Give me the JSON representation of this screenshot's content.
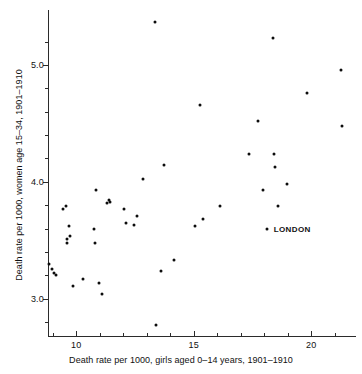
{
  "chart_data": {
    "type": "scatter",
    "title": "",
    "xlabel": "Death rate per 1000, girls aged  0–14 years, 1901–1910",
    "ylabel": "Death rate per 1000, women age 15–34, 1901–1910",
    "xlim": [
      8.8,
      21.9
    ],
    "ylim": [
      2.68,
      5.47
    ],
    "xticks": [
      10,
      15,
      20
    ],
    "xtick_labels": [
      "10",
      "15",
      "20"
    ],
    "xticks_minor": [
      9,
      11,
      12,
      13,
      14,
      16,
      17,
      18,
      19,
      21
    ],
    "yticks": [
      3.0,
      4.0,
      5.0
    ],
    "ytick_labels": [
      "3.0",
      "4.0",
      "5.0"
    ],
    "yticks_minor": [
      2.8,
      3.2,
      3.4,
      3.6,
      3.8,
      4.2,
      4.4,
      4.6,
      4.8,
      5.2
    ],
    "grid": false,
    "legend": false,
    "marker_color": "#0d0d0d",
    "axis_color": "#2b2b2b",
    "points": [
      {
        "x": 8.85,
        "y": 3.3
      },
      {
        "x": 8.95,
        "y": 3.25
      },
      {
        "x": 9.05,
        "y": 3.22
      },
      {
        "x": 9.15,
        "y": 3.2
      },
      {
        "x": 9.45,
        "y": 3.77
      },
      {
        "x": 9.55,
        "y": 3.79
      },
      {
        "x": 9.6,
        "y": 3.51
      },
      {
        "x": 9.62,
        "y": 3.48
      },
      {
        "x": 9.7,
        "y": 3.62
      },
      {
        "x": 9.75,
        "y": 3.54
      },
      {
        "x": 9.85,
        "y": 3.11
      },
      {
        "x": 10.3,
        "y": 3.17
      },
      {
        "x": 10.75,
        "y": 3.6
      },
      {
        "x": 10.8,
        "y": 3.48
      },
      {
        "x": 10.85,
        "y": 3.93
      },
      {
        "x": 10.95,
        "y": 3.13
      },
      {
        "x": 11.1,
        "y": 3.04
      },
      {
        "x": 11.3,
        "y": 3.82
      },
      {
        "x": 11.4,
        "y": 3.84
      },
      {
        "x": 11.45,
        "y": 3.83
      },
      {
        "x": 12.05,
        "y": 3.77
      },
      {
        "x": 12.1,
        "y": 3.65
      },
      {
        "x": 12.45,
        "y": 3.63
      },
      {
        "x": 12.6,
        "y": 3.71
      },
      {
        "x": 12.85,
        "y": 4.02
      },
      {
        "x": 13.35,
        "y": 5.37
      },
      {
        "x": 13.4,
        "y": 2.77
      },
      {
        "x": 13.6,
        "y": 3.24
      },
      {
        "x": 13.75,
        "y": 4.14
      },
      {
        "x": 14.15,
        "y": 3.33
      },
      {
        "x": 15.05,
        "y": 3.62
      },
      {
        "x": 15.25,
        "y": 4.66
      },
      {
        "x": 15.4,
        "y": 3.68
      },
      {
        "x": 16.1,
        "y": 3.79
      },
      {
        "x": 17.35,
        "y": 4.24
      },
      {
        "x": 17.75,
        "y": 4.52
      },
      {
        "x": 17.95,
        "y": 3.93
      },
      {
        "x": 18.1,
        "y": 3.6
      },
      {
        "x": 18.35,
        "y": 5.23
      },
      {
        "x": 18.4,
        "y": 4.24
      },
      {
        "x": 18.45,
        "y": 4.13
      },
      {
        "x": 18.6,
        "y": 3.79
      },
      {
        "x": 18.95,
        "y": 3.98
      },
      {
        "x": 19.8,
        "y": 4.76
      },
      {
        "x": 21.25,
        "y": 4.96
      },
      {
        "x": 21.3,
        "y": 4.48
      }
    ],
    "annotations": [
      {
        "label": "LONDON",
        "x": 18.1,
        "y": 3.6
      }
    ]
  }
}
